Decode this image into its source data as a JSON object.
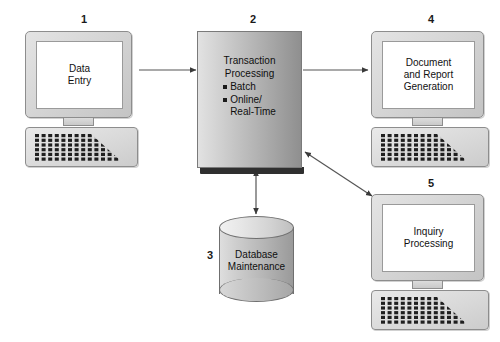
{
  "diagram": {
    "background_color": "#ffffff",
    "nodes": [
      {
        "id": "data-entry",
        "number": "1",
        "type": "computer",
        "label_lines": [
          "Data",
          "Entry"
        ],
        "label": "Data Entry"
      },
      {
        "id": "transaction-processing",
        "number": "2",
        "type": "process-box",
        "heading_lines": [
          "Transaction",
          "Processing"
        ],
        "heading": "Transaction Processing",
        "bullets": [
          {
            "text": "Batch",
            "continuation": null
          },
          {
            "text": "Online/",
            "continuation": "Real-Time"
          }
        ]
      },
      {
        "id": "database-maintenance",
        "number": "3",
        "type": "cylinder",
        "label_lines": [
          "Database",
          "Maintenance"
        ],
        "label": "Database Maintenance"
      },
      {
        "id": "document-report-generation",
        "number": "4",
        "type": "computer",
        "label_lines": [
          "Document",
          "and Report",
          "Generation"
        ],
        "label": "Document and Report Generation"
      },
      {
        "id": "inquiry-processing",
        "number": "5",
        "type": "computer",
        "label_lines": [
          "Inquiry",
          "Processing"
        ],
        "label": "Inquiry Processing"
      }
    ],
    "connectors": [
      {
        "id": "entry-to-processing",
        "from": "data-entry",
        "to": "transaction-processing",
        "direction": "one-way"
      },
      {
        "id": "processing-to-database",
        "from": "transaction-processing",
        "to": "database-maintenance",
        "direction": "two-way"
      },
      {
        "id": "processing-to-report",
        "from": "transaction-processing",
        "to": "document-report-generation",
        "direction": "one-way"
      },
      {
        "id": "processing-to-inquiry",
        "from": "transaction-processing",
        "to": "inquiry-processing",
        "direction": "two-way"
      }
    ],
    "colors": {
      "line": "#555555",
      "box_border": "#7a7a7a",
      "box_shadow": "#2f2f2f",
      "text": "#0f0f0f"
    }
  }
}
